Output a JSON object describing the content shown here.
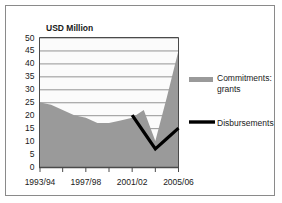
{
  "chart_data": {
    "type": "area",
    "title": "USD Million",
    "xlabel": "",
    "ylabel": "USD Million",
    "ylim": [
      0,
      50
    ],
    "ytick_step": 5,
    "yticks": [
      "0",
      "5",
      "10",
      "15",
      "20",
      "25",
      "30",
      "35",
      "40",
      "45",
      "50"
    ],
    "grid": true,
    "grid_axis": "y",
    "legend_position": "right",
    "categories": [
      "1993/94",
      "1994/95",
      "1995/96",
      "1996/97",
      "1997/98",
      "1998/99",
      "1999/00",
      "2000/01",
      "2001/02",
      "2002/03",
      "2003/04",
      "2004/05",
      "2005/06"
    ],
    "xtick_labels": [
      "1993/94",
      "1997/98",
      "2001/02",
      "2005/06"
    ],
    "xtick_label_indices": [
      0,
      4,
      8,
      12
    ],
    "series": [
      {
        "name": "Commitments: grants",
        "type": "area",
        "color": "#9a9a9a",
        "values": [
          25,
          24,
          22,
          20,
          19,
          17,
          17,
          18,
          19,
          22,
          10,
          27,
          45
        ]
      },
      {
        "name": "Disbursements",
        "type": "line",
        "color": "#000000",
        "values": [
          null,
          null,
          null,
          null,
          null,
          null,
          null,
          null,
          20,
          13.5,
          7,
          11,
          15
        ]
      }
    ]
  },
  "legend": {
    "items": [
      {
        "label_line1": "Commitments:",
        "label_line2": "grants",
        "marker": "area-swatch",
        "color": "#9a9a9a"
      },
      {
        "label_line1": "Disbursements",
        "label_line2": "",
        "marker": "line-swatch",
        "color": "#000000"
      }
    ]
  },
  "colors": {
    "area_fill": "#9a9a9a",
    "line": "#000000",
    "grid": "#7a7a7a",
    "axis": "#4a4a4a",
    "border": "#8a8a8a",
    "plot_background": "#fbfbfb",
    "page_background": "#ffffff"
  }
}
